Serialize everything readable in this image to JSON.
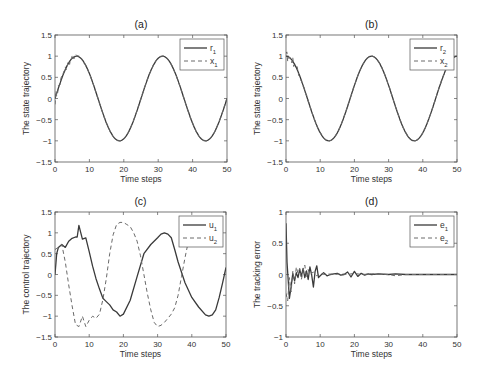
{
  "figure": {
    "width": 484,
    "height": 379,
    "line_color": "#3a3a3a",
    "axis_color": "#555555"
  },
  "chart_data": [
    {
      "id": "a",
      "type": "line",
      "title": "(a)",
      "xlabel": "Time steps",
      "ylabel": "The state trajectory",
      "xlim": [
        0,
        50
      ],
      "ylim": [
        -1.5,
        1.5
      ],
      "xticks": [
        0,
        10,
        20,
        30,
        40,
        50
      ],
      "yticks": [
        -1.5,
        -1,
        -0.5,
        0,
        0.5,
        1,
        1.5
      ],
      "ytick_labels": [
        "-1.5",
        "-1",
        "-0.5",
        "0",
        "0.5",
        "1",
        "1.5"
      ],
      "grid": false,
      "legend_position": "upper right",
      "box": [
        55,
        35,
        227,
        162
      ],
      "series": [
        {
          "name": "r",
          "sub": "1",
          "style": "solid",
          "func": "sin",
          "omega": 0.2513,
          "phase": 0
        },
        {
          "name": "x",
          "sub": "1",
          "style": "dashed",
          "func": "sin",
          "omega": 0.2513,
          "phase": 0,
          "noise_until": 10
        }
      ]
    },
    {
      "id": "b",
      "type": "line",
      "title": "(b)",
      "xlabel": "Time steps",
      "ylabel": "The state trajectory",
      "xlim": [
        0,
        50
      ],
      "ylim": [
        -1.5,
        1.5
      ],
      "xticks": [
        0,
        10,
        20,
        30,
        40,
        50
      ],
      "yticks": [
        -1.5,
        -1,
        -0.5,
        0,
        0.5,
        1,
        1.5
      ],
      "ytick_labels": [
        "-1.5",
        "-1",
        "-0.5",
        "0",
        "0.5",
        "1",
        "1.5"
      ],
      "grid": false,
      "legend_position": "upper right",
      "box": [
        286,
        35,
        457,
        162
      ],
      "series": [
        {
          "name": "r",
          "sub": "2",
          "style": "solid",
          "func": "cos",
          "omega": 0.2513,
          "phase": 0
        },
        {
          "name": "x",
          "sub": "2",
          "style": "dashed",
          "func": "cos",
          "omega": 0.2513,
          "phase": 0,
          "noise_until": 8
        }
      ]
    },
    {
      "id": "c",
      "type": "line",
      "title": "(c)",
      "xlabel": "Time steps",
      "ylabel": "The control trajectory",
      "xlim": [
        0,
        50
      ],
      "ylim": [
        -1.5,
        1.5
      ],
      "xticks": [
        0,
        10,
        20,
        30,
        40,
        50
      ],
      "yticks": [
        -1.5,
        -1,
        -0.5,
        0,
        0.5,
        1,
        1.5
      ],
      "ytick_labels": [
        "-1.5",
        "-1",
        "-0.5",
        "0",
        "0.5",
        "1",
        "1.5"
      ],
      "grid": false,
      "legend_position": "upper right",
      "box": [
        55,
        212,
        226,
        337
      ],
      "series": [
        {
          "name": "u",
          "sub": "1",
          "style": "solid",
          "x": [
            0,
            0.5,
            1,
            2,
            3,
            4,
            5,
            6,
            6.5,
            7,
            8,
            9,
            10,
            11,
            12,
            13,
            14,
            15,
            16,
            17,
            18,
            19,
            20,
            22,
            24,
            26,
            28,
            30,
            31,
            32,
            33,
            34,
            35,
            36,
            38,
            40,
            42,
            44,
            45,
            46,
            47,
            48,
            49,
            50
          ],
          "y": [
            0.0,
            0.5,
            0.65,
            0.72,
            0.65,
            0.8,
            0.87,
            0.9,
            0.9,
            1.18,
            0.85,
            0.88,
            0.55,
            0.2,
            -0.1,
            -0.35,
            -0.57,
            -0.65,
            -0.73,
            -0.85,
            -0.9,
            -1.0,
            -0.95,
            -0.62,
            -0.05,
            0.5,
            0.72,
            0.88,
            0.97,
            1.0,
            0.97,
            0.88,
            0.6,
            0.3,
            -0.2,
            -0.55,
            -0.78,
            -0.97,
            -1.0,
            -0.97,
            -0.85,
            -0.55,
            -0.2,
            0.17
          ]
        },
        {
          "name": "u",
          "sub": "2",
          "style": "dashed",
          "x": [
            0,
            1,
            2,
            3,
            4,
            5,
            6,
            7,
            8,
            9,
            10,
            11,
            12,
            13,
            14,
            15,
            16,
            17,
            18,
            19,
            20,
            21,
            22,
            23,
            24,
            25,
            26,
            27,
            28,
            29,
            30,
            31,
            32,
            33,
            34,
            35,
            36,
            37,
            38,
            39,
            40,
            41,
            42,
            43
          ],
          "y": [
            0.6,
            0.65,
            0.72,
            0.3,
            -0.25,
            -0.75,
            -1.2,
            -1.25,
            -1.0,
            -1.25,
            -1.1,
            -1.0,
            -1.05,
            -0.95,
            -0.6,
            -0.1,
            0.5,
            0.95,
            1.2,
            1.25,
            1.25,
            1.2,
            1.15,
            1.0,
            0.8,
            0.45,
            0.0,
            -0.45,
            -0.85,
            -1.15,
            -1.25,
            -1.22,
            -1.15,
            -1.05,
            -0.95,
            -0.8,
            -0.5,
            -0.05,
            0.4,
            0.8,
            1.0,
            1.2,
            1.25,
            1.2
          ]
        }
      ]
    },
    {
      "id": "d",
      "type": "line",
      "title": "(d)",
      "xlabel": "Time steps",
      "ylabel": "The tracking error",
      "xlim": [
        0,
        50
      ],
      "ylim": [
        -1,
        1
      ],
      "xticks": [
        0,
        10,
        20,
        30,
        40,
        50
      ],
      "yticks": [
        -1,
        -0.5,
        0,
        0.5,
        1
      ],
      "ytick_labels": [
        "-1",
        "-0.5",
        "0",
        "0.5",
        "1"
      ],
      "grid": false,
      "legend_position": "upper right",
      "box": [
        286,
        212,
        457,
        337
      ],
      "series": [
        {
          "name": "e",
          "sub": "1",
          "style": "solid",
          "x": [
            0,
            0.3,
            1,
            1.5,
            2,
            2.5,
            3,
            3.5,
            4,
            4.5,
            5,
            5.5,
            6,
            6.5,
            7,
            7.5,
            8,
            8.5,
            9,
            9.5,
            10,
            11,
            12,
            13,
            14,
            15,
            16,
            17,
            18,
            19,
            20,
            21,
            22,
            23,
            24,
            25,
            27,
            30,
            32,
            35,
            40,
            45,
            50
          ],
          "y": [
            0.82,
            0.2,
            -0.38,
            -0.2,
            0.02,
            -0.1,
            0.03,
            -0.05,
            0.08,
            -0.03,
            0.1,
            -0.05,
            0.06,
            -0.08,
            0.12,
            0.0,
            -0.2,
            0.05,
            0.14,
            -0.05,
            -0.02,
            0.03,
            -0.02,
            0.0,
            0.01,
            0.02,
            -0.01,
            0.0,
            0.04,
            -0.04,
            0.05,
            -0.03,
            0.02,
            -0.01,
            0.01,
            0.0,
            0.01,
            0.0,
            0.01,
            0.0,
            0.0,
            0.0,
            0.0
          ]
        },
        {
          "name": "e",
          "sub": "2",
          "style": "dashed",
          "x": [
            0,
            0.5,
            1,
            1.5,
            2,
            2.5,
            3,
            3.5,
            4,
            4.5,
            5,
            5.5,
            6,
            6.5,
            7,
            8,
            9,
            10,
            11,
            12,
            14,
            16,
            18,
            20,
            22,
            25,
            30,
            32,
            35,
            40,
            45,
            50
          ],
          "y": [
            -0.3,
            -0.42,
            -0.05,
            -0.28,
            0.05,
            -0.15,
            0.12,
            0.02,
            0.1,
            -0.08,
            0.06,
            0.15,
            -0.05,
            0.08,
            0.0,
            0.04,
            -0.02,
            0.02,
            0.0,
            0.01,
            0.0,
            0.01,
            0.0,
            0.02,
            0.0,
            0.01,
            0.0,
            -0.02,
            0.0,
            0.0,
            0.0,
            0.0
          ]
        }
      ]
    }
  ]
}
